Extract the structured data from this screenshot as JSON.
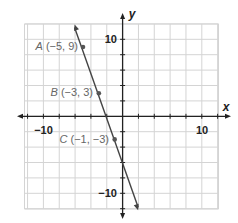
{
  "chart_data": {
    "type": "line",
    "title": "",
    "xlabel": "x",
    "ylabel": "y",
    "xlim": [
      -12.3,
      12
    ],
    "ylim": [
      -12,
      12
    ],
    "grid": true,
    "grid_step": 2,
    "x_tick_labels": [
      "-10",
      "10"
    ],
    "y_tick_labels": [
      "10",
      "-10"
    ],
    "x_tick_labels_display": [
      "−10",
      "10"
    ],
    "y_tick_labels_display": [
      "10",
      "−10"
    ],
    "series": [
      {
        "name": "line through A, B, C",
        "equation": "y = -3x - 6",
        "slope": -3,
        "y_intercept": -6,
        "endpoints": [
          [
            -6,
            12
          ],
          [
            2,
            -12
          ]
        ],
        "arrows": "both"
      }
    ],
    "points": [
      {
        "name": "A",
        "x": -5,
        "y": 9,
        "label": "A",
        "coords": "(−5, 9)"
      },
      {
        "name": "B",
        "x": -3,
        "y": 3,
        "label": "B",
        "coords": "(−3, 3)"
      },
      {
        "name": "C",
        "x": -1,
        "y": -3,
        "label": "C",
        "coords": "(−1, −3)"
      }
    ],
    "colors": {
      "grid": "#d4d4d4",
      "axis": "#222222",
      "line": "#444444",
      "point": "#555555",
      "point_label": "#666666"
    }
  }
}
